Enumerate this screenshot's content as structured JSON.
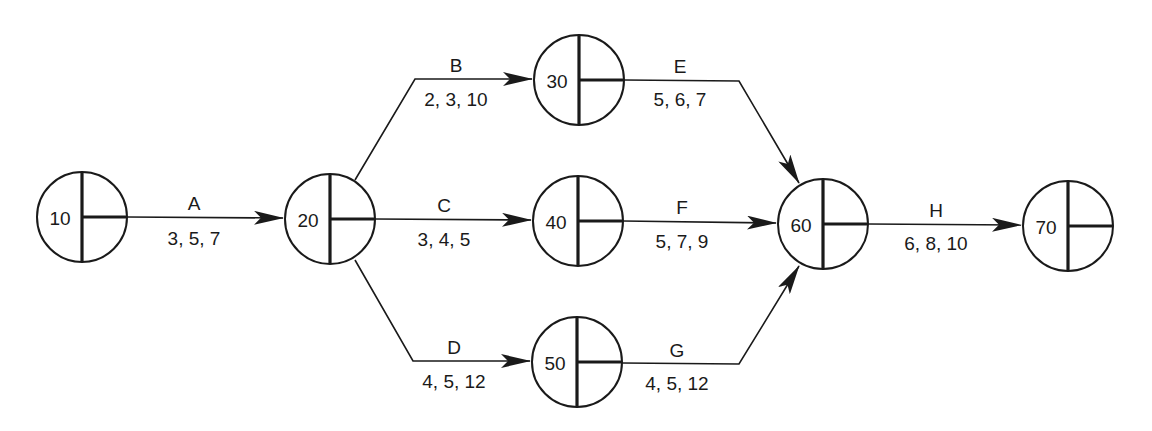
{
  "diagram": {
    "type": "activity-on-arrow network (PERT)",
    "nodes": [
      {
        "id": "10",
        "label": "10",
        "cx": 82,
        "cy": 217
      },
      {
        "id": "20",
        "label": "20",
        "cx": 330,
        "cy": 219
      },
      {
        "id": "30",
        "label": "30",
        "cx": 579,
        "cy": 80
      },
      {
        "id": "40",
        "label": "40",
        "cx": 578,
        "cy": 221
      },
      {
        "id": "50",
        "label": "50",
        "cx": 577,
        "cy": 362
      },
      {
        "id": "60",
        "label": "60",
        "cx": 823,
        "cy": 224
      },
      {
        "id": "70",
        "label": "70",
        "cx": 1068,
        "cy": 226
      }
    ],
    "activities": [
      {
        "name": "A",
        "from": "10",
        "to": "20",
        "times": "3, 5, 7"
      },
      {
        "name": "B",
        "from": "20",
        "to": "30",
        "times": "2, 3, 10"
      },
      {
        "name": "C",
        "from": "20",
        "to": "40",
        "times": "3, 4, 5"
      },
      {
        "name": "D",
        "from": "20",
        "to": "50",
        "times": "4, 5, 12"
      },
      {
        "name": "E",
        "from": "30",
        "to": "60",
        "times": "5, 6, 7"
      },
      {
        "name": "F",
        "from": "40",
        "to": "60",
        "times": "5, 7, 9"
      },
      {
        "name": "G",
        "from": "50",
        "to": "60",
        "times": "4, 5, 12"
      },
      {
        "name": "H",
        "from": "60",
        "to": "70",
        "times": "6, 8, 10"
      }
    ]
  },
  "labels": {
    "nodes": {
      "n10": "10",
      "n20": "20",
      "n30": "30",
      "n40": "40",
      "n50": "50",
      "n60": "60",
      "n70": "70"
    },
    "A": {
      "name": "A",
      "times": "3, 5, 7"
    },
    "B": {
      "name": "B",
      "times": "2, 3, 10"
    },
    "C": {
      "name": "C",
      "times": "3, 4, 5"
    },
    "D": {
      "name": "D",
      "times": "4, 5, 12"
    },
    "E": {
      "name": "E",
      "times": "5, 6, 7"
    },
    "F": {
      "name": "F",
      "times": "5, 7, 9"
    },
    "G": {
      "name": "G",
      "times": "4, 5, 12"
    },
    "H": {
      "name": "H",
      "times": "6, 8, 10"
    }
  },
  "colors": {
    "ink": "#1a1a1a",
    "background": "#ffffff"
  }
}
